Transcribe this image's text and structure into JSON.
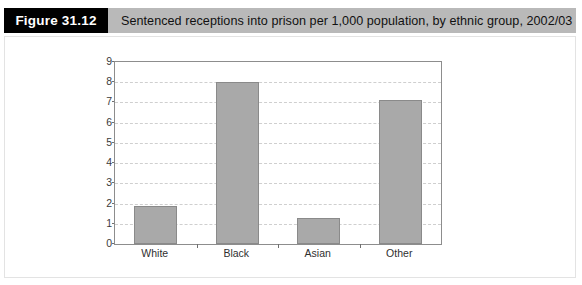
{
  "figure": {
    "number_label": "Figure 31.12",
    "caption": "Sentenced receptions into prison per 1,000 population, by ethnic group, 2002/03"
  },
  "colors": {
    "header_band": "#b9b9b9",
    "number_box": "#000000",
    "bar_fill": "#a9a9a9",
    "bar_border": "#8a8a8a",
    "axis": "#8d8d8d",
    "gridline": "#cfcfcf",
    "card_border": "#e3e3e3"
  },
  "chart_data": {
    "type": "bar",
    "title": "Sentenced receptions into prison per 1,000 population, by ethnic group, 2002/03",
    "xlabel": "",
    "ylabel": "",
    "categories": [
      "White",
      "Black",
      "Asian",
      "Other"
    ],
    "values": [
      1.9,
      8.0,
      1.3,
      7.1
    ],
    "ylim": [
      0,
      9
    ],
    "ytick_values": [
      0,
      1,
      2,
      3,
      4,
      5,
      6,
      7,
      8,
      9
    ],
    "ytick_labels": [
      "0",
      "1",
      "2",
      "3",
      "4",
      "5",
      "6",
      "7",
      "8",
      "9"
    ],
    "grid": true,
    "grid_axis": "y",
    "grid_style": "dashed",
    "legend": false,
    "legend_position": "none",
    "series": [
      {
        "name": "Sentenced receptions per 1,000 population",
        "values": [
          1.9,
          8.0,
          1.3,
          7.1
        ]
      }
    ]
  }
}
